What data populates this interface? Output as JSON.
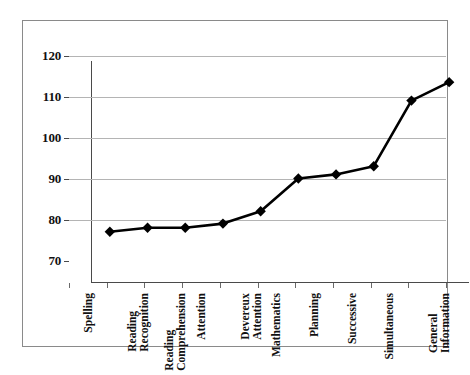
{
  "chart_data": {
    "type": "line",
    "title": "",
    "xlabel": "",
    "ylabel": "",
    "ylim": [
      70,
      120
    ],
    "yticks": [
      70,
      80,
      90,
      100,
      110,
      120
    ],
    "grid": true,
    "legend": "none",
    "marker": "diamond",
    "line_color": "#000000",
    "grid_color": "#b4b4b4",
    "categories": [
      "Spelling",
      "Reading Recognition",
      "Reading Comprehension",
      "Attention",
      "Devereux Attention",
      "Mathematics",
      "Planning",
      "Successive",
      "Simultaneous",
      "General Information"
    ],
    "category_lines": [
      [
        "Spelling"
      ],
      [
        "Reading",
        "Recognition"
      ],
      [
        "Reading",
        "Comprehension"
      ],
      [
        "Attention"
      ],
      [
        "Devereux",
        "Attention"
      ],
      [
        "Mathematics"
      ],
      [
        "Planning"
      ],
      [
        "Successive"
      ],
      [
        "Simultaneous"
      ],
      [
        "General",
        "Information"
      ]
    ],
    "values": [
      82,
      83,
      83,
      84,
      87,
      95,
      96,
      98,
      114,
      118.5
    ]
  }
}
